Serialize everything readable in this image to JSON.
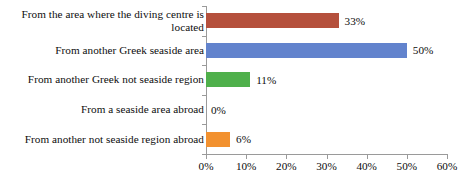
{
  "chart_data": {
    "type": "bar",
    "orientation": "horizontal",
    "title": "",
    "subtitle": "",
    "xlabel": "",
    "ylabel": "",
    "xlim": [
      0,
      60
    ],
    "xtick_step": 10,
    "grid": false,
    "legend": "none",
    "value_suffix": "%",
    "categories": [
      "From the area where the diving centre is located",
      "From another Greek seaside area",
      "From another Greek not seaside region",
      "From a seaside area abroad",
      "From another not seaside region abroad"
    ],
    "category_lines": [
      [
        "From the area where the diving centre is",
        "located"
      ],
      [
        "From another Greek seaside area"
      ],
      [
        "From another Greek not seaside region"
      ],
      [
        "From a seaside area abroad"
      ],
      [
        "From another not seaside region abroad"
      ]
    ],
    "values": [
      33,
      50,
      11,
      0,
      6
    ],
    "data_labels": [
      "33%",
      "50%",
      "11%",
      "0%",
      "6%"
    ],
    "bar_colors": [
      "#b5503c",
      "#6283cd",
      "#4fb04b",
      "#7f7f7f",
      "#f2912f"
    ],
    "xtick_labels": [
      "0%",
      "10%",
      "20%",
      "30%",
      "40%",
      "50%",
      "60%"
    ],
    "xtick_values": [
      0,
      10,
      20,
      30,
      40,
      50,
      60
    ],
    "axis_color": "#9a9a9a",
    "text_color": "#0d0d0d",
    "background_color": "#ffffff"
  }
}
